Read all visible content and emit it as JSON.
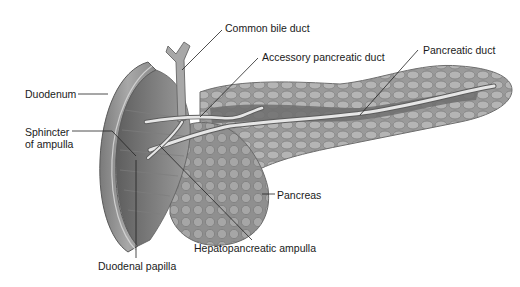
{
  "figure": {
    "labels": {
      "common_bile_duct": "Common bile duct",
      "accessory_pancreatic_duct": "Accessory pancreatic duct",
      "pancreatic_duct": "Pancreatic duct",
      "duodenum": "Duodenum",
      "sphincter_line1": "Sphincter",
      "sphincter_line2": "of ampulla",
      "pancreas": "Pancreas",
      "hepatopancreatic_ampulla": "Hepatopancreatic ampulla",
      "duodenal_papilla": "Duodenal papilla"
    },
    "colors": {
      "background": "#ffffff",
      "tissue_dark": "#6e6e6e",
      "tissue_mid": "#9a9a9a",
      "tissue_light": "#cfcfcf",
      "duct": "#e6e6e6",
      "leader_line": "#222222",
      "text": "#1a1a1a"
    }
  }
}
